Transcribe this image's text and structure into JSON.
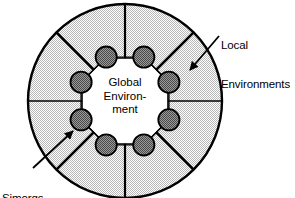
{
  "diagram": {
    "center_label": {
      "line1": "Global",
      "line2": "Environ-",
      "line3": "ment"
    },
    "annotations": {
      "local_environments": {
        "line1": "Local",
        "line2": "Environments"
      },
      "simorgs": {
        "line1": "Simorgs"
      }
    },
    "colors": {
      "outline": "#000000",
      "sector_fill": "#d9d9d9",
      "simorg_fill": "#808080",
      "center_fill": "#ffffff",
      "background": "#ffffff"
    },
    "geometry": {
      "outer_circle": {
        "cx": 125,
        "cy": 101,
        "r": 97
      },
      "spoke_count": 8,
      "simorg_count": 8,
      "simorg_radius": 10.5,
      "simorg_ring_radius": 49
    }
  }
}
